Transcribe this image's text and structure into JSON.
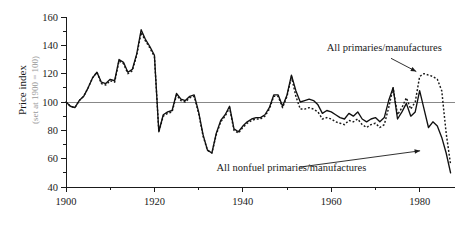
{
  "chart_data": {
    "type": "line",
    "title": "",
    "xlabel": "",
    "ylabel": "Price index",
    "ylabel_sub": "(set at 1900 = 100)",
    "xlim": [
      1900,
      1988
    ],
    "ylim": [
      40,
      160
    ],
    "ytick_labels": [
      "160",
      "140",
      "120",
      "100",
      "80",
      "60",
      "40"
    ],
    "ytick_values": [
      160,
      140,
      120,
      100,
      80,
      60,
      40
    ],
    "yminor_step": 10,
    "xtick_labels": [
      "1900",
      "1920",
      "1940",
      "1960",
      "1980"
    ],
    "xtick_values": [
      1900,
      1920,
      1940,
      1960,
      1980
    ],
    "xminor_values": [
      1910,
      1930,
      1950,
      1970
    ],
    "grid": false,
    "reference_line": 100,
    "legend": "annotations",
    "annotations": [
      {
        "text": "All primaries/manufactures",
        "x": 1972,
        "y": 136,
        "points_to_x": 1980,
        "points_to_y": 120
      },
      {
        "text": "All nonfuel primaries/manufactures",
        "x": 1951,
        "y": 51,
        "points_to_x": 1981,
        "points_to_y": 66
      }
    ],
    "series": [
      {
        "name": "All primaries/manufactures",
        "style": "dotted",
        "color": "#1a1a1a",
        "x": [
          1900,
          1901,
          1902,
          1903,
          1904,
          1905,
          1906,
          1907,
          1908,
          1909,
          1910,
          1911,
          1912,
          1913,
          1914,
          1915,
          1916,
          1917,
          1918,
          1919,
          1920,
          1921,
          1922,
          1923,
          1924,
          1925,
          1926,
          1927,
          1928,
          1929,
          1930,
          1931,
          1932,
          1933,
          1934,
          1935,
          1936,
          1937,
          1938,
          1939,
          1940,
          1941,
          1942,
          1943,
          1944,
          1945,
          1946,
          1947,
          1948,
          1949,
          1950,
          1951,
          1952,
          1953,
          1954,
          1955,
          1956,
          1957,
          1958,
          1959,
          1960,
          1961,
          1962,
          1963,
          1964,
          1965,
          1966,
          1967,
          1968,
          1969,
          1970,
          1971,
          1972,
          1973,
          1974,
          1975,
          1976,
          1977,
          1978,
          1979,
          1980,
          1981,
          1982,
          1983,
          1984,
          1985,
          1986,
          1987
        ],
        "y": [
          100,
          97,
          96,
          101,
          104,
          110,
          117,
          121,
          113,
          112,
          115,
          114,
          129,
          127,
          120,
          122,
          133,
          149,
          143,
          138,
          132,
          79,
          90,
          92,
          93,
          105,
          101,
          100,
          103,
          104,
          92,
          76,
          66,
          64,
          77,
          86,
          90,
          96,
          80,
          78,
          82,
          85,
          87,
          88,
          88,
          90,
          95,
          104,
          104,
          96,
          104,
          118,
          104,
          95,
          95,
          96,
          95,
          93,
          88,
          89,
          88,
          86,
          85,
          84,
          87,
          86,
          88,
          84,
          82,
          84,
          85,
          82,
          84,
          96,
          110,
          91,
          96,
          103,
          95,
          100,
          118,
          120,
          119,
          118,
          116,
          108,
          78,
          56
        ]
      },
      {
        "name": "All nonfuel primaries/manufactures",
        "style": "solid",
        "color": "#111111",
        "x": [
          1900,
          1901,
          1902,
          1903,
          1904,
          1905,
          1906,
          1907,
          1908,
          1909,
          1910,
          1911,
          1912,
          1913,
          1914,
          1915,
          1916,
          1917,
          1918,
          1919,
          1920,
          1921,
          1922,
          1923,
          1924,
          1925,
          1926,
          1927,
          1928,
          1929,
          1930,
          1931,
          1932,
          1933,
          1934,
          1935,
          1936,
          1937,
          1938,
          1939,
          1940,
          1941,
          1942,
          1943,
          1944,
          1945,
          1946,
          1947,
          1948,
          1949,
          1950,
          1951,
          1952,
          1953,
          1954,
          1955,
          1956,
          1957,
          1958,
          1959,
          1960,
          1961,
          1962,
          1963,
          1964,
          1965,
          1966,
          1967,
          1968,
          1969,
          1970,
          1971,
          1972,
          1973,
          1974,
          1975,
          1976,
          1977,
          1978,
          1979,
          1980,
          1981,
          1982,
          1983,
          1984,
          1985,
          1986,
          1987
        ],
        "y": [
          100,
          97,
          96,
          101,
          104,
          110,
          117,
          121,
          114,
          113,
          116,
          115,
          130,
          128,
          121,
          123,
          134,
          151,
          144,
          139,
          133,
          79,
          91,
          93,
          94,
          106,
          102,
          101,
          104,
          105,
          93,
          77,
          66,
          64,
          78,
          87,
          91,
          97,
          81,
          79,
          83,
          86,
          88,
          89,
          89,
          91,
          96,
          105,
          105,
          97,
          105,
          119,
          108,
          100,
          101,
          102,
          101,
          98,
          92,
          94,
          93,
          91,
          89,
          88,
          92,
          90,
          93,
          88,
          86,
          88,
          89,
          86,
          89,
          101,
          110,
          88,
          93,
          99,
          90,
          93,
          108,
          95,
          82,
          86,
          83,
          75,
          64,
          50
        ]
      }
    ]
  }
}
